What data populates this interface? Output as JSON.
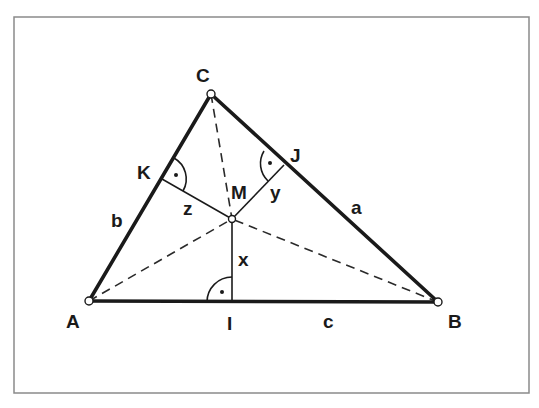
{
  "diagram": {
    "colors": {
      "line": "#1a1a1a",
      "frame": "#8a8a8a",
      "background": "#ffffff"
    },
    "frame": {
      "x": 14,
      "y": 17,
      "width": 515,
      "height": 376
    },
    "points": {
      "A": {
        "label": "A",
        "x": 89,
        "y": 301
      },
      "B": {
        "label": "B",
        "x": 438,
        "y": 302
      },
      "C": {
        "label": "C",
        "x": 211,
        "y": 94
      },
      "M": {
        "label": "M",
        "x": 232,
        "y": 219
      },
      "I": {
        "label": "I",
        "x": 232,
        "y": 302
      },
      "K": {
        "label": "K",
        "x": 162,
        "y": 179
      },
      "J": {
        "label": "J",
        "x": 284,
        "y": 165
      }
    },
    "sides": [
      {
        "label": "a",
        "from": "B",
        "to": "C"
      },
      {
        "label": "b",
        "from": "A",
        "to": "C"
      },
      {
        "label": "c",
        "from": "A",
        "to": "B"
      }
    ],
    "segments": [
      {
        "label": "x",
        "from": "M",
        "to": "I",
        "type": "perpendicular"
      },
      {
        "label": "y",
        "from": "M",
        "to": "J",
        "type": "perpendicular"
      },
      {
        "label": "z",
        "from": "M",
        "to": "K",
        "type": "perpendicular"
      }
    ],
    "dashed_lines": [
      {
        "from": "A",
        "to": "M"
      },
      {
        "from": "B",
        "to": "M"
      },
      {
        "from": "C",
        "to": "M"
      }
    ],
    "right_angle_markers": [
      "I",
      "J",
      "K"
    ],
    "labels": {
      "A": "A",
      "B": "B",
      "C": "C",
      "M": "M",
      "I": "I",
      "K": "K",
      "J": "J",
      "a": "a",
      "b": "b",
      "c": "c",
      "x": "x",
      "y": "y",
      "z": "z"
    }
  }
}
